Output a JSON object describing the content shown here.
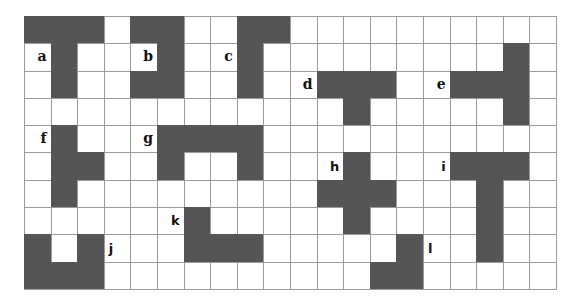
{
  "grid": {
    "columns": 20,
    "rows": 10,
    "fill_color": "#555555",
    "line_color": "#9a9a9a"
  },
  "shapes": [
    {
      "id": "a",
      "cells": [
        [
          0,
          0
        ],
        [
          0,
          1
        ],
        [
          0,
          2
        ],
        [
          1,
          1
        ],
        [
          2,
          1
        ]
      ]
    },
    {
      "id": "b",
      "cells": [
        [
          0,
          4
        ],
        [
          0,
          5
        ],
        [
          1,
          5
        ],
        [
          2,
          4
        ],
        [
          2,
          5
        ]
      ]
    },
    {
      "id": "c",
      "cells": [
        [
          0,
          8
        ],
        [
          0,
          9
        ],
        [
          1,
          8
        ],
        [
          2,
          8
        ]
      ]
    },
    {
      "id": "d",
      "cells": [
        [
          2,
          11
        ],
        [
          2,
          12
        ],
        [
          2,
          13
        ],
        [
          3,
          12
        ]
      ]
    },
    {
      "id": "e",
      "cells": [
        [
          1,
          18
        ],
        [
          2,
          16
        ],
        [
          2,
          17
        ],
        [
          2,
          18
        ],
        [
          3,
          18
        ]
      ]
    },
    {
      "id": "f",
      "cells": [
        [
          4,
          1
        ],
        [
          5,
          1
        ],
        [
          5,
          2
        ],
        [
          6,
          1
        ]
      ]
    },
    {
      "id": "g",
      "cells": [
        [
          4,
          5
        ],
        [
          4,
          6
        ],
        [
          4,
          7
        ],
        [
          4,
          8
        ],
        [
          5,
          5
        ],
        [
          5,
          8
        ]
      ]
    },
    {
      "id": "h",
      "cells": [
        [
          5,
          12
        ],
        [
          6,
          11
        ],
        [
          6,
          12
        ],
        [
          6,
          13
        ],
        [
          7,
          12
        ]
      ]
    },
    {
      "id": "i",
      "cells": [
        [
          5,
          16
        ],
        [
          5,
          17
        ],
        [
          5,
          18
        ],
        [
          6,
          17
        ],
        [
          7,
          17
        ],
        [
          8,
          17
        ]
      ]
    },
    {
      "id": "j",
      "cells": [
        [
          8,
          0
        ],
        [
          8,
          2
        ],
        [
          9,
          0
        ],
        [
          9,
          1
        ],
        [
          9,
          2
        ]
      ]
    },
    {
      "id": "k",
      "cells": [
        [
          7,
          6
        ],
        [
          8,
          6
        ],
        [
          8,
          7
        ],
        [
          8,
          8
        ]
      ]
    },
    {
      "id": "l",
      "cells": [
        [
          8,
          14
        ],
        [
          9,
          13
        ],
        [
          9,
          14
        ]
      ]
    }
  ],
  "labels": [
    {
      "text": "a",
      "row": 1,
      "col": 0,
      "align": "right",
      "font": "serif"
    },
    {
      "text": "b",
      "row": 1,
      "col": 4,
      "align": "right",
      "font": "serif"
    },
    {
      "text": "c",
      "row": 1,
      "col": 7,
      "align": "right",
      "font": "serif"
    },
    {
      "text": "d",
      "row": 2,
      "col": 10,
      "align": "right",
      "font": "serif"
    },
    {
      "text": "e",
      "row": 2,
      "col": 15,
      "align": "right",
      "font": "serif"
    },
    {
      "text": "f",
      "row": 4,
      "col": 0,
      "align": "right",
      "font": "serif"
    },
    {
      "text": "g",
      "row": 4,
      "col": 4,
      "align": "right",
      "font": "serif"
    },
    {
      "text": "h",
      "row": 5,
      "col": 11,
      "align": "right",
      "font": "sans"
    },
    {
      "text": "i",
      "row": 5,
      "col": 15,
      "align": "right",
      "font": "sans"
    },
    {
      "text": "j",
      "row": 8,
      "col": 3,
      "align": "left",
      "font": "sans"
    },
    {
      "text": "k",
      "row": 7,
      "col": 5,
      "align": "right",
      "font": "sans"
    },
    {
      "text": "l",
      "row": 8,
      "col": 15,
      "align": "left",
      "font": "sans"
    }
  ]
}
